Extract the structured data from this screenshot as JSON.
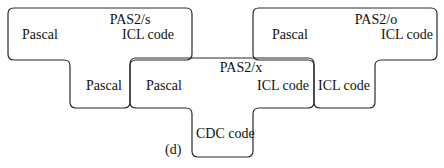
{
  "diagram": {
    "type": "T-diagram",
    "caption": "(d)",
    "stroke_color": "#2a2a2a",
    "compilers": [
      {
        "name": "PAS2/s",
        "source": "Pascal",
        "target": "ICL code",
        "implementation": "Pascal"
      },
      {
        "name": "PAS2/x",
        "source": "Pascal",
        "target": "ICL code",
        "implementation": "CDC code"
      },
      {
        "name": "PAS2/o",
        "source": "Pascal",
        "target": "ICL code",
        "implementation": "ICL code"
      }
    ]
  }
}
